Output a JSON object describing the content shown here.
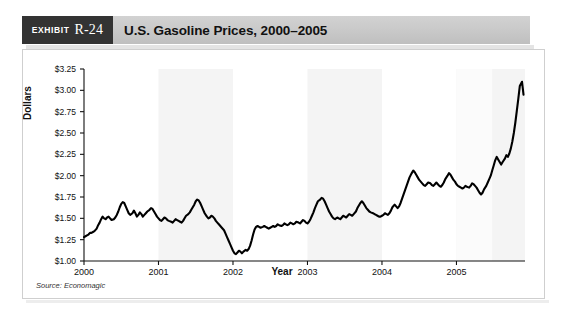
{
  "exhibit": {
    "word": "Exhibit",
    "number": "R-24"
  },
  "header": {
    "title": "U.S. Gasoline Prices, 2000–2005"
  },
  "source_note": "Source: Economagic",
  "colors": {
    "exhibit_box": "#333333",
    "header_bar": "#cacaca",
    "line": "#000000",
    "band": "#f4f4f4",
    "panel_border": "#cfcfcf",
    "text": "#111111"
  },
  "chart_data": {
    "type": "line",
    "title": "U.S. Gasoline Prices, 2000–2005",
    "xlabel": "Year",
    "ylabel": "Dollars",
    "source": "Source: Economagic",
    "grid": false,
    "legend": "none",
    "alternating_year_bands": true,
    "xlim": [
      2000.0,
      2005.92
    ],
    "ylim": [
      1.0,
      3.25
    ],
    "ytick_labels": [
      "$3.25",
      "$3.00",
      "$2.75",
      "$2.50",
      "$2.25",
      "$2.00",
      "$1.75",
      "$1.50",
      "$1.25",
      "$1.00"
    ],
    "ytick_values": [
      3.25,
      3.0,
      2.75,
      2.5,
      2.25,
      2.0,
      1.75,
      1.5,
      1.25,
      1.0
    ],
    "xtick_labels": [
      "2000",
      "2001",
      "2002",
      "2003",
      "2004",
      "2005"
    ],
    "xtick_values": [
      2000,
      2001,
      2002,
      2003,
      2004,
      2005
    ],
    "series": [
      {
        "name": "U.S. Gasoline Price",
        "units": "dollars per gallon",
        "x": [
          2000.0,
          2000.02,
          2000.04,
          2000.06,
          2000.08,
          2000.1,
          2000.12,
          2000.14,
          2000.17,
          2000.19,
          2000.21,
          2000.23,
          2000.25,
          2000.27,
          2000.29,
          2000.31,
          2000.33,
          2000.35,
          2000.37,
          2000.4,
          2000.42,
          2000.44,
          2000.46,
          2000.48,
          2000.5,
          2000.52,
          2000.54,
          2000.56,
          2000.58,
          2000.6,
          2000.62,
          2000.65,
          2000.67,
          2000.69,
          2000.71,
          2000.73,
          2000.75,
          2000.77,
          2000.79,
          2000.81,
          2000.83,
          2000.85,
          2000.88,
          2000.9,
          2000.92,
          2000.94,
          2000.96,
          2000.98,
          2001.0,
          2001.02,
          2001.04,
          2001.06,
          2001.08,
          2001.1,
          2001.12,
          2001.14,
          2001.17,
          2001.19,
          2001.21,
          2001.23,
          2001.25,
          2001.27,
          2001.29,
          2001.31,
          2001.33,
          2001.35,
          2001.37,
          2001.4,
          2001.42,
          2001.44,
          2001.46,
          2001.48,
          2001.5,
          2001.52,
          2001.54,
          2001.56,
          2001.58,
          2001.6,
          2001.62,
          2001.65,
          2001.67,
          2001.69,
          2001.71,
          2001.73,
          2001.75,
          2001.77,
          2001.79,
          2001.81,
          2001.83,
          2001.85,
          2001.88,
          2001.9,
          2001.92,
          2001.94,
          2001.96,
          2001.98,
          2002.0,
          2002.02,
          2002.04,
          2002.06,
          2002.08,
          2002.1,
          2002.12,
          2002.14,
          2002.17,
          2002.19,
          2002.21,
          2002.23,
          2002.25,
          2002.27,
          2002.29,
          2002.31,
          2002.33,
          2002.35,
          2002.37,
          2002.4,
          2002.42,
          2002.44,
          2002.46,
          2002.48,
          2002.5,
          2002.52,
          2002.54,
          2002.56,
          2002.58,
          2002.6,
          2002.62,
          2002.65,
          2002.67,
          2002.69,
          2002.71,
          2002.73,
          2002.75,
          2002.77,
          2002.79,
          2002.81,
          2002.83,
          2002.85,
          2002.88,
          2002.9,
          2002.92,
          2002.94,
          2002.96,
          2002.98,
          2003.0,
          2003.02,
          2003.04,
          2003.06,
          2003.08,
          2003.1,
          2003.12,
          2003.14,
          2003.17,
          2003.19,
          2003.21,
          2003.23,
          2003.25,
          2003.27,
          2003.29,
          2003.31,
          2003.33,
          2003.35,
          2003.37,
          2003.4,
          2003.42,
          2003.44,
          2003.46,
          2003.48,
          2003.5,
          2003.52,
          2003.54,
          2003.56,
          2003.58,
          2003.6,
          2003.62,
          2003.65,
          2003.67,
          2003.69,
          2003.71,
          2003.73,
          2003.75,
          2003.77,
          2003.79,
          2003.81,
          2003.83,
          2003.85,
          2003.88,
          2003.9,
          2003.92,
          2003.94,
          2003.96,
          2003.98,
          2004.0,
          2004.02,
          2004.04,
          2004.06,
          2004.08,
          2004.1,
          2004.12,
          2004.14,
          2004.17,
          2004.19,
          2004.21,
          2004.23,
          2004.25,
          2004.27,
          2004.29,
          2004.31,
          2004.33,
          2004.35,
          2004.37,
          2004.4,
          2004.42,
          2004.44,
          2004.46,
          2004.48,
          2004.5,
          2004.52,
          2004.54,
          2004.56,
          2004.58,
          2004.6,
          2004.62,
          2004.65,
          2004.67,
          2004.69,
          2004.71,
          2004.73,
          2004.75,
          2004.77,
          2004.79,
          2004.81,
          2004.83,
          2004.85,
          2004.88,
          2004.9,
          2004.92,
          2004.94,
          2004.96,
          2004.98,
          2005.0,
          2005.02,
          2005.04,
          2005.06,
          2005.08,
          2005.1,
          2005.12,
          2005.14,
          2005.17,
          2005.19,
          2005.21,
          2005.23,
          2005.25,
          2005.27,
          2005.29,
          2005.31,
          2005.33,
          2005.35,
          2005.37,
          2005.4,
          2005.42,
          2005.44,
          2005.46,
          2005.48,
          2005.5,
          2005.52,
          2005.54,
          2005.56,
          2005.58,
          2005.6,
          2005.62,
          2005.65,
          2005.67,
          2005.69,
          2005.71,
          2005.73,
          2005.75,
          2005.77,
          2005.79,
          2005.81,
          2005.83,
          2005.85,
          2005.88,
          2005.9
        ],
        "y": [
          1.28,
          1.29,
          1.3,
          1.31,
          1.33,
          1.33,
          1.34,
          1.35,
          1.38,
          1.42,
          1.45,
          1.49,
          1.52,
          1.5,
          1.49,
          1.51,
          1.52,
          1.5,
          1.48,
          1.49,
          1.51,
          1.54,
          1.58,
          1.63,
          1.67,
          1.69,
          1.68,
          1.64,
          1.6,
          1.56,
          1.54,
          1.56,
          1.59,
          1.56,
          1.52,
          1.54,
          1.57,
          1.55,
          1.52,
          1.54,
          1.56,
          1.58,
          1.6,
          1.62,
          1.61,
          1.58,
          1.55,
          1.52,
          1.5,
          1.48,
          1.47,
          1.49,
          1.51,
          1.5,
          1.48,
          1.47,
          1.46,
          1.45,
          1.47,
          1.49,
          1.48,
          1.47,
          1.46,
          1.45,
          1.47,
          1.5,
          1.53,
          1.55,
          1.57,
          1.6,
          1.63,
          1.66,
          1.7,
          1.72,
          1.71,
          1.68,
          1.64,
          1.6,
          1.56,
          1.52,
          1.5,
          1.51,
          1.53,
          1.52,
          1.5,
          1.47,
          1.45,
          1.43,
          1.41,
          1.39,
          1.36,
          1.32,
          1.28,
          1.24,
          1.2,
          1.16,
          1.12,
          1.09,
          1.08,
          1.1,
          1.12,
          1.11,
          1.09,
          1.11,
          1.13,
          1.12,
          1.14,
          1.18,
          1.24,
          1.31,
          1.37,
          1.4,
          1.41,
          1.4,
          1.39,
          1.4,
          1.41,
          1.4,
          1.39,
          1.38,
          1.39,
          1.4,
          1.41,
          1.4,
          1.41,
          1.43,
          1.42,
          1.41,
          1.42,
          1.44,
          1.43,
          1.42,
          1.43,
          1.45,
          1.44,
          1.43,
          1.44,
          1.46,
          1.45,
          1.44,
          1.46,
          1.48,
          1.47,
          1.45,
          1.44,
          1.46,
          1.49,
          1.53,
          1.57,
          1.62,
          1.66,
          1.7,
          1.72,
          1.74,
          1.73,
          1.7,
          1.66,
          1.62,
          1.58,
          1.55,
          1.52,
          1.5,
          1.49,
          1.51,
          1.5,
          1.49,
          1.51,
          1.53,
          1.52,
          1.51,
          1.53,
          1.55,
          1.54,
          1.53,
          1.55,
          1.58,
          1.62,
          1.65,
          1.68,
          1.7,
          1.68,
          1.65,
          1.62,
          1.6,
          1.58,
          1.57,
          1.56,
          1.55,
          1.54,
          1.53,
          1.52,
          1.52,
          1.53,
          1.54,
          1.56,
          1.55,
          1.54,
          1.56,
          1.59,
          1.63,
          1.66,
          1.64,
          1.62,
          1.64,
          1.68,
          1.73,
          1.78,
          1.83,
          1.88,
          1.93,
          1.98,
          2.03,
          2.06,
          2.04,
          2.01,
          1.98,
          1.95,
          1.93,
          1.91,
          1.89,
          1.88,
          1.9,
          1.92,
          1.91,
          1.89,
          1.88,
          1.9,
          1.92,
          1.9,
          1.88,
          1.87,
          1.89,
          1.92,
          1.96,
          2.0,
          2.03,
          2.01,
          1.98,
          1.95,
          1.93,
          1.9,
          1.88,
          1.87,
          1.86,
          1.85,
          1.86,
          1.88,
          1.87,
          1.86,
          1.88,
          1.91,
          1.9,
          1.88,
          1.86,
          1.83,
          1.8,
          1.78,
          1.8,
          1.84,
          1.88,
          1.92,
          1.96,
          2.0,
          2.06,
          2.12,
          2.18,
          2.22,
          2.19,
          2.16,
          2.13,
          2.16,
          2.2,
          2.24,
          2.22,
          2.26,
          2.32,
          2.4,
          2.5,
          2.62,
          2.76,
          2.9,
          3.05,
          3.1,
          2.95
        ]
      }
    ],
    "annotations": {
      "start_value": 1.28,
      "min_value": 1.08,
      "min_location": "early 2002",
      "max_value": 3.1,
      "max_location": "late 2005",
      "end_value": 2.95
    }
  }
}
